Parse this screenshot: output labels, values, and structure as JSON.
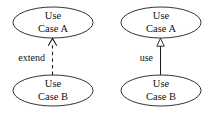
{
  "diagram": {
    "type": "uml-use-case-relationships",
    "background_color": "#ffffff",
    "stroke_color": "#1c1c1c",
    "text_color": "#121212",
    "fragments": [
      {
        "id": "extend-fragment",
        "source_node": {
          "line1": "Use",
          "line2": "Case B"
        },
        "target_node": {
          "line1": "Use",
          "line2": "Case A"
        },
        "relationship": {
          "label": "extend",
          "line_style": "dashed",
          "arrow_head": "open-arrow",
          "direction": "bottom-to-top"
        }
      },
      {
        "id": "use-fragment",
        "source_node": {
          "line1": "Use",
          "line2": "Case B"
        },
        "target_node": {
          "line1": "Use",
          "line2": "Case A"
        },
        "relationship": {
          "label": "use",
          "line_style": "solid",
          "arrow_head": "hollow-triangle",
          "direction": "bottom-to-top"
        }
      }
    ]
  }
}
